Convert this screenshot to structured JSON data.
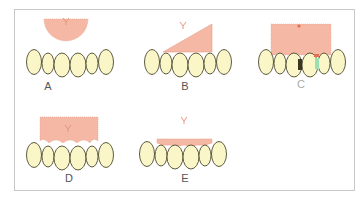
{
  "figure": {
    "panels": [
      {
        "id": "A",
        "label": "A",
        "shape": "half-ellipse"
      },
      {
        "id": "B",
        "label": "B",
        "shape": "triangle"
      },
      {
        "id": "C",
        "label": "C",
        "shape": "rectangle"
      },
      {
        "id": "D",
        "label": "D",
        "shape": "scalloped-rectangle"
      },
      {
        "id": "E",
        "label": "E",
        "shape": "thin-strip"
      }
    ],
    "colors": {
      "graft_fill": "#f4b8a4",
      "graft_stroke": "#e8957e",
      "tooth_fill": "#fbf6c8",
      "tooth_stroke": "#4a4a30",
      "frenum_mark": "#e8957e",
      "frame_border": "#c8c8c8"
    }
  }
}
